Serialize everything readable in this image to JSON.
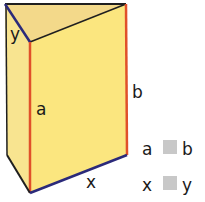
{
  "diagram": {
    "type": "triangular-prism",
    "labels": {
      "y": "y",
      "b": "b",
      "a": "a",
      "x": "x"
    },
    "legend": [
      {
        "left": "a",
        "right": "b"
      },
      {
        "left": "x",
        "right": "y"
      }
    ],
    "colors": {
      "face_front": "#fbe67f",
      "face_side": "#f8e490",
      "face_top": "#f3d98a",
      "edge_red": "#e0502a",
      "edge_blue": "#2b2a7a",
      "edge_black": "#1f1f1f",
      "legend_box": "#c8c8c8"
    }
  }
}
